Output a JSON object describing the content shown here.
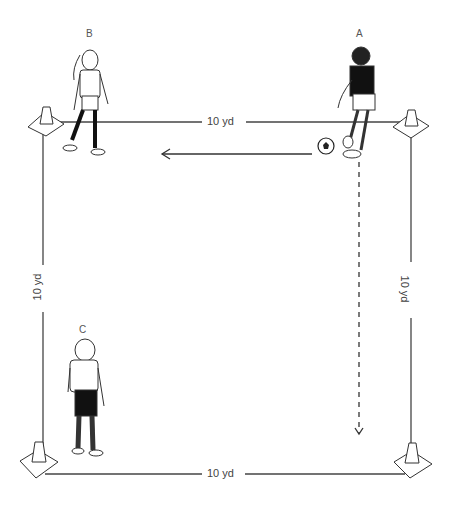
{
  "diagram": {
    "type": "soccer passing drill",
    "grid": {
      "top_label": "10 yd",
      "bottom_label": "10 yd",
      "left_label": "10 yd",
      "right_label": "10 yd"
    },
    "players": [
      {
        "id": "A",
        "label": "A",
        "position": "top-right",
        "has_ball": true
      },
      {
        "id": "B",
        "label": "B",
        "position": "top-left"
      },
      {
        "id": "C",
        "label": "C",
        "position": "bottom-left"
      }
    ],
    "cones": [
      "top-left",
      "top-right",
      "bottom-left",
      "bottom-right"
    ],
    "arrows": [
      {
        "type": "solid",
        "meaning": "pass",
        "from": "A",
        "to": "B"
      },
      {
        "type": "dashed",
        "meaning": "run",
        "from": "A",
        "direction": "down"
      }
    ],
    "colors": {
      "line": "#333333",
      "background": "#ffffff"
    }
  }
}
